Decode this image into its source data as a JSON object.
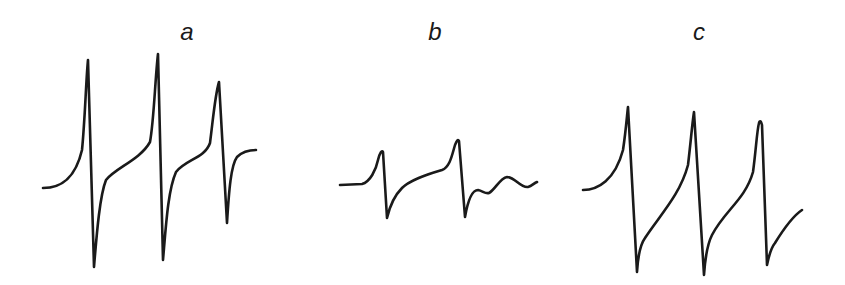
{
  "figure": {
    "panels": [
      {
        "label": "a",
        "label_pos": {
          "x": 187,
          "y": 20
        },
        "color": "#1a1a1a",
        "path": "M43,188 C60,188 75,180 82,150 C85,120 86,80 88,60 L94,267 C97,230 100,195 106,180 C115,168 140,160 150,142 C154,120 155,80 158,54 L163,260 C166,225 168,190 176,172 C185,160 205,158 210,143 C213,120 215,95 219,82 L227,223 C229,190 231,165 237,157 C243,151 250,150 256,150"
      },
      {
        "label": "b",
        "label_pos": {
          "x": 435,
          "y": 20
        },
        "color": "#1a1a1a",
        "path": "M340,185 L362,184 C370,182 376,170 378,160 C380,152 382,150 383,152 L387,218 C390,205 395,195 402,188 C410,180 425,175 442,170 C450,167 452,155 455,145 C457,140 458,139 459,141 L465,217 C468,200 472,190 478,190 C483,191 485,194 489,193 C495,190 500,178 507,177 C515,177 520,188 528,187 C532,186 534,183 537,182"
      },
      {
        "label": "c",
        "label_pos": {
          "x": 699,
          "y": 20
        },
        "color": "#1a1a1a",
        "path": "M583,190 C598,190 615,180 623,150 C626,130 627,115 628,107 L637,272 C638,255 640,245 645,238 C660,215 680,195 688,165 C691,140 692,125 694,112 L704,275 C705,260 707,245 712,235 C725,210 745,200 753,172 C756,150 757,130 759,123 C760,120 761,121 762,125 L767,265 C769,255 771,248 775,243 C783,230 793,216 802,210"
      }
    ]
  }
}
